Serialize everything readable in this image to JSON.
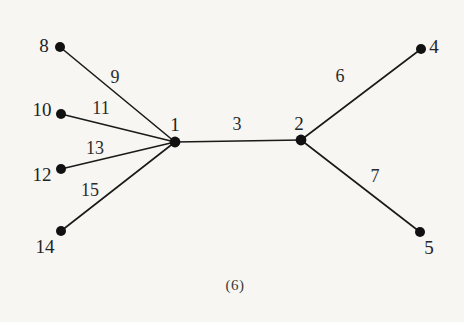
{
  "figure": {
    "caption": "(6)",
    "background_color": "#f7f6f3",
    "stroke_color": "#1a1a1a",
    "node_fill": "#111111"
  },
  "graph_data": {
    "type": "node-link-diagram",
    "description": "Tree graph with two internal vertices labelled 1 and 2; vertex 1 has pendant neighbours 8, 10, 12, 14 and vertex 2 has pendant neighbours 4 and 5. Edges are labelled with numbers.",
    "nodes": [
      {
        "id": "8",
        "label": "8",
        "x": 60,
        "y": 47,
        "label_x": 44,
        "label_y": 45
      },
      {
        "id": "10",
        "label": "10",
        "x": 61,
        "y": 114,
        "label_x": 42,
        "label_y": 109
      },
      {
        "id": "12",
        "label": "12",
        "x": 61,
        "y": 169,
        "label_x": 42,
        "label_y": 174
      },
      {
        "id": "14",
        "label": "14",
        "x": 61,
        "y": 231,
        "label_x": 45,
        "label_y": 246
      },
      {
        "id": "1",
        "label": "1",
        "x": 175,
        "y": 142,
        "label_x": 175,
        "label_y": 124
      },
      {
        "id": "2",
        "label": "2",
        "x": 301,
        "y": 140,
        "label_x": 299,
        "label_y": 123
      },
      {
        "id": "4",
        "label": "4",
        "x": 421,
        "y": 49,
        "label_x": 434,
        "label_y": 46
      },
      {
        "id": "5",
        "label": "5",
        "x": 420,
        "y": 232,
        "label_x": 429,
        "label_y": 247
      }
    ],
    "edges": [
      {
        "source": "8",
        "target": "1",
        "label": "9",
        "label_x": 115,
        "label_y": 77
      },
      {
        "source": "10",
        "target": "1",
        "label": "11",
        "label_x": 101,
        "label_y": 108
      },
      {
        "source": "12",
        "target": "1",
        "label": "13",
        "label_x": 95,
        "label_y": 148
      },
      {
        "source": "14",
        "target": "1",
        "label": "15",
        "label_x": 90,
        "label_y": 190
      },
      {
        "source": "1",
        "target": "2",
        "label": "3",
        "label_x": 237,
        "label_y": 124
      },
      {
        "source": "2",
        "target": "4",
        "label": "6",
        "label_x": 340,
        "label_y": 76
      },
      {
        "source": "2",
        "target": "5",
        "label": "7",
        "label_x": 375,
        "label_y": 176
      }
    ]
  }
}
